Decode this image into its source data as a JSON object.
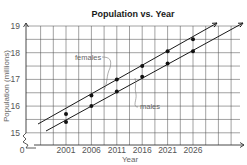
{
  "chart_data": {
    "type": "scatter",
    "title": "Population vs. Year",
    "xlabel": "Year",
    "ylabel": "Population (millions)",
    "x": [
      2001,
      2006,
      2011,
      2016,
      2021,
      2026
    ],
    "x_tick_labels": [
      "2001",
      "2006",
      "2011",
      "2016",
      "2021",
      "2026"
    ],
    "y_tick_labels": [
      "15",
      "16",
      "17",
      "18",
      "19"
    ],
    "origin_label": "0",
    "xlim": [
      1993.5,
      2036.5
    ],
    "ylim": [
      14.5,
      19
    ],
    "axis_break": true,
    "grid": true,
    "series": [
      {
        "name": "females",
        "values": [
          15.7,
          16.4,
          17.0,
          17.5,
          18.05,
          18.5
        ],
        "trend_line": true
      },
      {
        "name": "males",
        "values": [
          15.4,
          16.0,
          16.55,
          17.1,
          17.6,
          18.05
        ],
        "trend_line": true
      }
    ],
    "annotations": [
      "females",
      "males"
    ]
  }
}
